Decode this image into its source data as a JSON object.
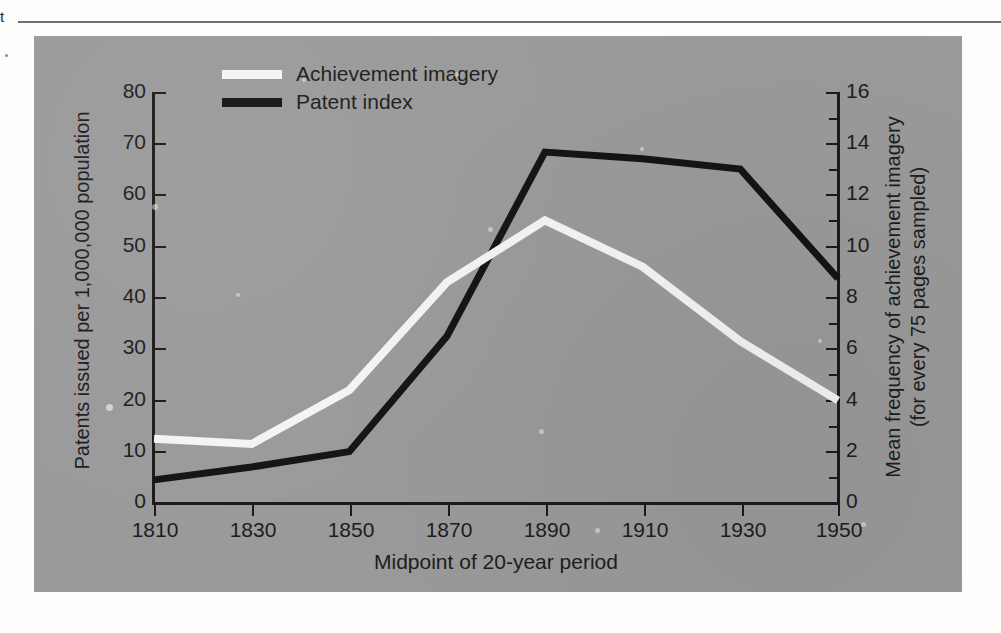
{
  "page": {
    "margin_text": "t"
  },
  "legend": {
    "position": "top-left-inside",
    "items": [
      {
        "label": "Achievement imagery",
        "color": "#f4f4f2",
        "swatch": "white-line-swatch"
      },
      {
        "label": "Patent index",
        "color": "#141414",
        "swatch": "black-line-swatch"
      }
    ]
  },
  "axes": {
    "left_title": "Patents issued per 1,000,000 population",
    "right_title_line1": "Mean frequency of achievement imagery",
    "right_title_line2": "(for every 75 pages sampled)",
    "bottom_title": "Midpoint of 20-year period",
    "left_ticks": [
      "80",
      "70",
      "60",
      "50",
      "40",
      "30",
      "20",
      "10",
      "0"
    ],
    "right_ticks": [
      "16",
      "14",
      "12",
      "10",
      "8",
      "6",
      "4",
      "2",
      "0"
    ],
    "x_ticks": [
      "1810",
      "1830",
      "1850",
      "1870",
      "1890",
      "1910",
      "1930",
      "1950"
    ]
  },
  "chart_data": {
    "type": "line",
    "title": "",
    "xlabel": "Midpoint of 20-year period",
    "ylabel": "Patents issued per 1,000,000 population",
    "y2label": "Mean frequency of achievement imagery (for every 75 pages sampled)",
    "x": [
      1810,
      1830,
      1850,
      1870,
      1890,
      1910,
      1930,
      1950
    ],
    "xlim": [
      1810,
      1950
    ],
    "ylim": [
      0,
      80
    ],
    "y2lim": [
      0,
      16
    ],
    "grid": false,
    "legend_position": "upper left",
    "series": [
      {
        "name": "Achievement imagery",
        "axis": "right",
        "color": "#f4f4f2",
        "values_right_axis": [
          2.5,
          2.3,
          4.4,
          8.6,
          11.0,
          9.2,
          6.3,
          4.0
        ],
        "values_left_axis_equivalent": [
          12.5,
          11.5,
          22.0,
          43.0,
          55.0,
          46.0,
          31.5,
          20.0
        ]
      },
      {
        "name": "Patent index",
        "axis": "left",
        "color": "#141414",
        "values_left_axis": [
          4.5,
          7.0,
          10.0,
          32.5,
          68.3,
          67.0,
          65.0,
          43.7
        ],
        "values_right_axis_equivalent": [
          0.9,
          1.4,
          2.0,
          6.5,
          13.7,
          13.4,
          13.0,
          8.8
        ]
      }
    ]
  },
  "colors": {
    "panel_background": "#9a9a9a",
    "page_background": "#fdfdfc",
    "axis": "#1b1b1b",
    "achievement_line": "#f4f4f2",
    "patent_line": "#141414"
  }
}
